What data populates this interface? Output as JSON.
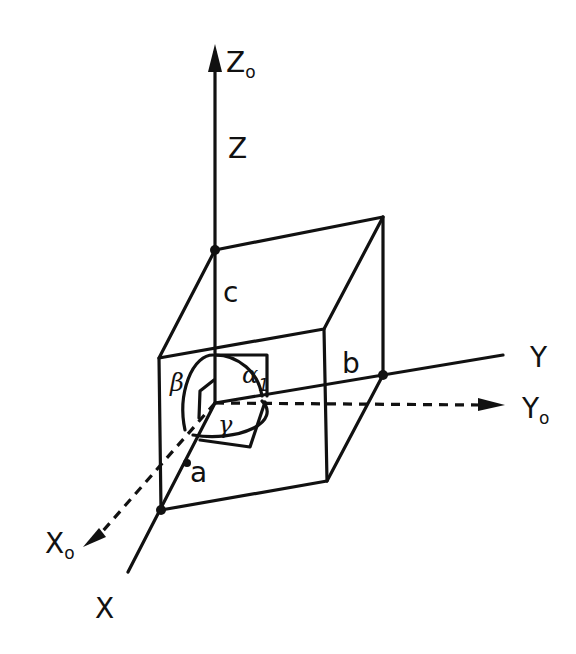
{
  "diagram": {
    "type": "crystallographic unit cell (axial system)",
    "axes": {
      "z0": {
        "label": "Z",
        "subscript": "o"
      },
      "z": {
        "label": "Z"
      },
      "y": {
        "label": "Y"
      },
      "y0": {
        "label": "Y",
        "subscript": "o"
      },
      "x": {
        "label": "X"
      },
      "x0": {
        "label": "X",
        "subscript": "o"
      }
    },
    "edges": {
      "a": "a",
      "b": "b",
      "c": "c"
    },
    "angles": {
      "alpha": "α",
      "alpha_sub": "1",
      "beta": "β",
      "gamma": "γ"
    },
    "colors": {
      "ink": "#111111",
      "background": "#ffffff"
    }
  }
}
